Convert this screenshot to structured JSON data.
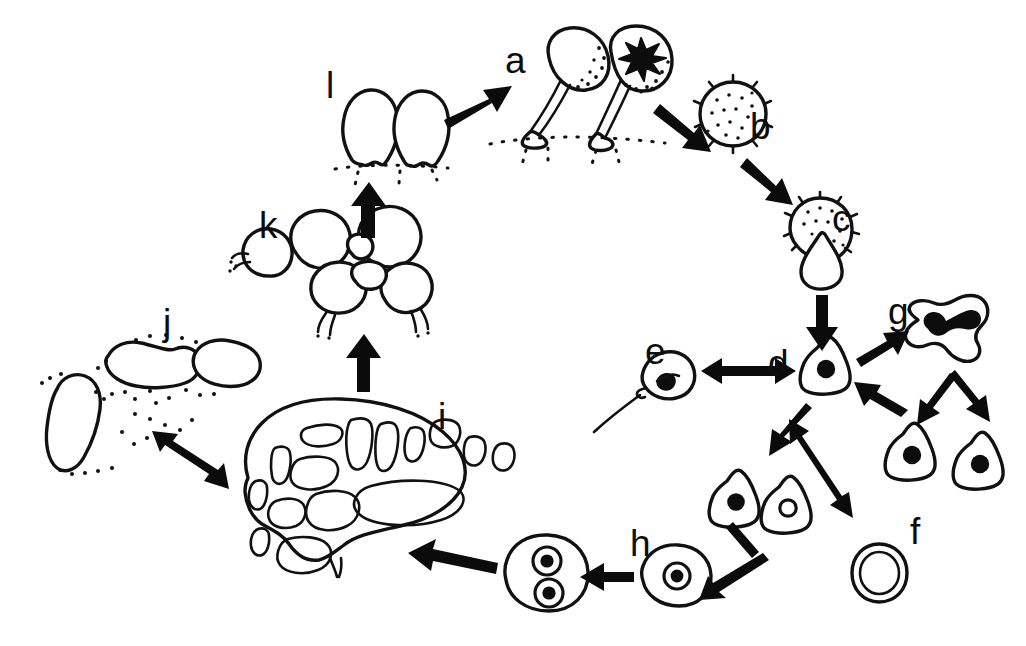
{
  "figure": {
    "background_color": "#ffffff",
    "ink_color": "#111111",
    "width": 1026,
    "height": 646
  },
  "stages": [
    {
      "id": "a",
      "label": "a",
      "label_x": 505,
      "label_y": 42,
      "name": "sporangia-fruiting-bodies",
      "caption": "Two stalked sporangia (fruiting bodies) on substrate; the right one is dehiscing and releasing spores"
    },
    {
      "id": "b",
      "label": "b",
      "label_x": 750,
      "label_y": 108,
      "name": "spore",
      "caption": "Round spiny stippled spore"
    },
    {
      "id": "c",
      "label": "c",
      "label_x": 832,
      "label_y": 200,
      "name": "germinating-spore",
      "caption": "Germinating spore with emerging protoplast splitting the spore wall"
    },
    {
      "id": "d",
      "label": "d",
      "label_x": 768,
      "label_y": 345,
      "name": "myxamoeba",
      "caption": "Myxamoeba with single nucleus - central hub of the life cycle"
    },
    {
      "id": "e",
      "label": "e",
      "label_x": 645,
      "label_y": 333,
      "name": "swarm-cell-flagellate",
      "caption": "Flagellated swarm cell (myxoflagellate) with a single long flagellum"
    },
    {
      "id": "f",
      "label": "f",
      "label_x": 910,
      "label_y": 513,
      "name": "microcyst",
      "caption": "Microcyst - encysted rounded cell with double wall"
    },
    {
      "id": "g",
      "label": "g",
      "label_x": 888,
      "label_y": 293,
      "name": "mitotic-division",
      "caption": "Mitotic division: dumbbell nucleus dividing into two daughter myxamoebae"
    },
    {
      "id": "h",
      "label": "h",
      "label_x": 630,
      "label_y": 525,
      "name": "zygote-binucleate",
      "caption": "Fusion of two compatible cells forming a zygote, then a binucleate cell"
    },
    {
      "id": "i",
      "label": "i",
      "label_x": 438,
      "label_y": 398,
      "name": "plasmodium",
      "caption": "Reticulate plasmodium with network of veins and fan-shaped margin"
    },
    {
      "id": "j",
      "label": "j",
      "label_x": 163,
      "label_y": 304,
      "name": "sclerotium-spherules",
      "caption": "Sclerotium - dormant elongate spherules in a dried matrix"
    },
    {
      "id": "k",
      "label": "k",
      "label_x": 259,
      "label_y": 207,
      "name": "plasmodium-aggregating",
      "caption": "Plasmodium rounding up into clustered lobes prior to fruiting"
    },
    {
      "id": "l",
      "label": "l",
      "label_x": 326,
      "label_y": 67,
      "name": "immature-sporangia",
      "caption": "Two immature sporangium primordia (young fruiting body initials) on substrate"
    }
  ],
  "arrows": [
    {
      "name": "arrow-l-to-a",
      "from": "l",
      "to": "a",
      "style": "single"
    },
    {
      "name": "arrow-a-to-b",
      "from": "a",
      "to": "b",
      "style": "single"
    },
    {
      "name": "arrow-b-to-c",
      "from": "b",
      "to": "c",
      "style": "single"
    },
    {
      "name": "arrow-c-to-d",
      "from": "c",
      "to": "d",
      "style": "single"
    },
    {
      "name": "arrow-d-to-e",
      "from": "d",
      "to": "e",
      "style": "double"
    },
    {
      "name": "arrow-d-to-g",
      "from": "d",
      "to": "g",
      "style": "single"
    },
    {
      "name": "arrow-g-to-d",
      "from": "g",
      "to": "d",
      "style": "single"
    },
    {
      "name": "arrow-g-division-left",
      "from": "g",
      "to": "daughter-cell-left",
      "style": "single"
    },
    {
      "name": "arrow-g-division-right",
      "from": "g",
      "to": "daughter-cell-right",
      "style": "single"
    },
    {
      "name": "arrow-d-to-f",
      "from": "d",
      "to": "f",
      "style": "double"
    },
    {
      "name": "arrow-d-to-gametes",
      "from": "d",
      "to": "gamete-pair",
      "style": "single"
    },
    {
      "name": "arrow-gametes-to-h",
      "from": "gamete-pair",
      "to": "h",
      "style": "single"
    },
    {
      "name": "arrow-h-to-binucleate",
      "from": "h",
      "to": "binucleate-cell",
      "style": "single"
    },
    {
      "name": "arrow-h-to-i",
      "from": "h",
      "to": "i",
      "style": "single"
    },
    {
      "name": "arrow-i-to-j",
      "from": "i",
      "to": "j",
      "style": "double"
    },
    {
      "name": "arrow-i-to-k",
      "from": "i",
      "to": "k",
      "style": "single"
    },
    {
      "name": "arrow-k-to-l",
      "from": "k",
      "to": "l",
      "style": "single"
    }
  ]
}
